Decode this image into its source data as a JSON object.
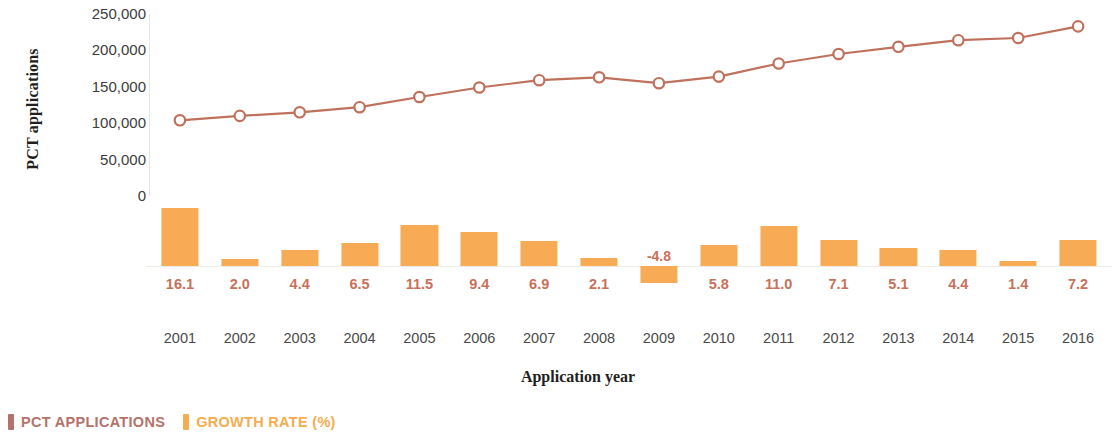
{
  "chart_data": {
    "type": "line",
    "title": "",
    "xlabel": "Application year",
    "ylabel": "PCT applications",
    "categories": [
      "2001",
      "2002",
      "2003",
      "2004",
      "2005",
      "2006",
      "2007",
      "2008",
      "2009",
      "2010",
      "2011",
      "2012",
      "2013",
      "2014",
      "2015",
      "2016"
    ],
    "ylim": [
      0,
      250000
    ],
    "yticks": [
      "250,000",
      "200,000",
      "150,000",
      "100,000",
      "50,000",
      "0"
    ],
    "ytick_values": [
      250000,
      200000,
      150000,
      100000,
      50000,
      0
    ],
    "grid": false,
    "legend_position": "bottom-left",
    "series": [
      {
        "name": "PCT APPLICATIONS",
        "type": "line",
        "color": "#c0715c",
        "marker": "open-circle",
        "values": [
          104000,
          110000,
          115000,
          122000,
          136000,
          149000,
          159000,
          163000,
          155000,
          164000,
          182000,
          195000,
          205000,
          214000,
          217000,
          233000
        ]
      },
      {
        "name": "GROWTH RATE (%)",
        "type": "bar",
        "color": "#f7ab55",
        "label_color": "#c8715a",
        "values": [
          16.1,
          2.0,
          4.4,
          6.5,
          11.5,
          9.4,
          6.9,
          2.1,
          -4.8,
          5.8,
          11.0,
          7.1,
          5.1,
          4.4,
          1.4,
          7.2
        ],
        "value_labels": [
          "16.1",
          "2.0",
          "4.4",
          "6.5",
          "11.5",
          "9.4",
          "6.9",
          "2.1",
          "-4.8",
          "5.8",
          "11.0",
          "7.1",
          "5.1",
          "4.4",
          "1.4",
          "7.2"
        ]
      }
    ]
  },
  "axes": {
    "y_title": "PCT applications",
    "x_title": "Application year"
  },
  "legend": {
    "items": [
      {
        "label": "PCT APPLICATIONS",
        "color": "#b5726a"
      },
      {
        "label": "GROWTH RATE (%)",
        "color": "#f5ad4e"
      }
    ]
  }
}
